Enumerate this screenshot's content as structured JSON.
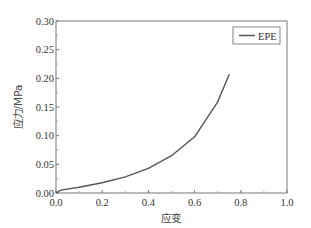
{
  "chart_data": {
    "type": "line",
    "title": "",
    "xlabel": "应变",
    "ylabel": "应力/MPa",
    "xlim": [
      0.0,
      1.0
    ],
    "ylim": [
      0.0,
      0.3
    ],
    "xticks": [
      "0.0",
      "0.2",
      "0.4",
      "0.6",
      "0.8",
      "1.0"
    ],
    "yticks": [
      "0.00",
      "0.05",
      "0.10",
      "0.15",
      "0.20",
      "0.25",
      "0.30"
    ],
    "grid": false,
    "legend_position": "upper right",
    "series": [
      {
        "name": "EPE",
        "color": "#555555",
        "x": [
          0.0,
          0.02,
          0.1,
          0.2,
          0.3,
          0.4,
          0.5,
          0.6,
          0.7,
          0.75
        ],
        "y": [
          0.0,
          0.005,
          0.01,
          0.018,
          0.028,
          0.043,
          0.065,
          0.098,
          0.159,
          0.207
        ]
      }
    ]
  }
}
